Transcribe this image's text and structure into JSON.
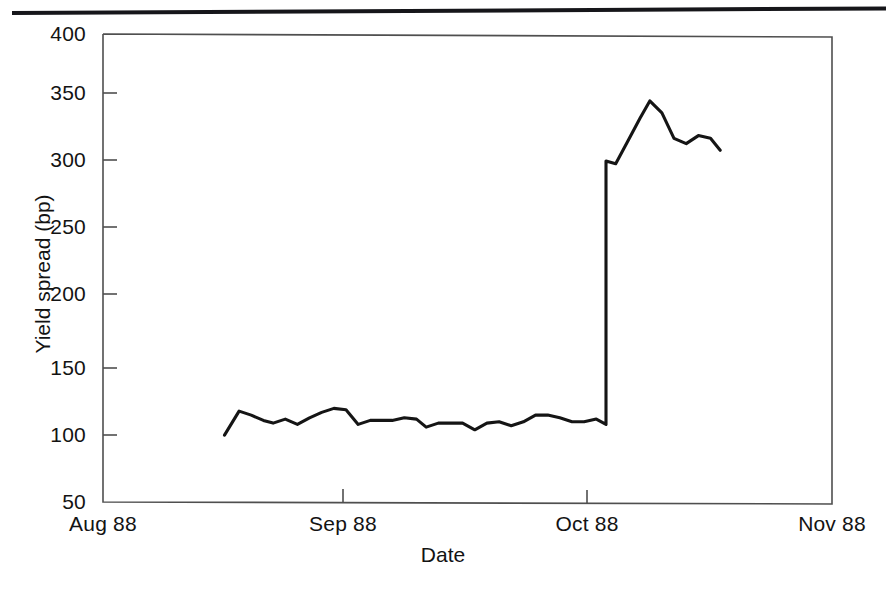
{
  "figure": {
    "page_rule": "horizontal-rule",
    "line_color": "#151515",
    "frame_color": "#4a4a4a"
  },
  "chart_data": {
    "type": "line",
    "title": "",
    "xlabel": "Date",
    "ylabel": "Yield spread (bp)",
    "ylim": [
      50,
      400
    ],
    "yticks": [
      50,
      100,
      150,
      200,
      250,
      300,
      350,
      400
    ],
    "ytick_labels": [
      "50",
      "100",
      "150",
      "200",
      "250",
      "300",
      "350",
      "400"
    ],
    "xticks": [
      0,
      1,
      2,
      3
    ],
    "xtick_labels": [
      "Aug 88",
      "Sep 88",
      "Oct 88",
      "Nov 88"
    ],
    "grid": false,
    "legend": null,
    "series": [
      {
        "name": "Yield spread",
        "x": [
          0.5,
          0.56,
          0.61,
          0.66,
          0.7,
          0.75,
          0.8,
          0.85,
          0.9,
          0.95,
          1.0,
          1.05,
          1.1,
          1.14,
          1.19,
          1.24,
          1.29,
          1.33,
          1.38,
          1.43,
          1.48,
          1.53,
          1.58,
          1.63,
          1.68,
          1.73,
          1.78,
          1.83,
          1.88,
          1.93,
          1.98,
          2.03,
          2.07,
          2.07,
          2.11,
          2.16,
          2.21,
          2.25,
          2.3,
          2.35,
          2.4,
          2.45,
          2.5,
          2.54
        ],
        "y": [
          100,
          118,
          115,
          111,
          109,
          112,
          108,
          113,
          117,
          120,
          119,
          108,
          111,
          111,
          111,
          113,
          112,
          106,
          109,
          109,
          109,
          104,
          109,
          110,
          107,
          110,
          115,
          115,
          113,
          110,
          110,
          112,
          108,
          305,
          303,
          320,
          337,
          350,
          341,
          322,
          318,
          324,
          322,
          313
        ]
      }
    ],
    "annotations": [
      {
        "text": "sharp jump in yield spread in early October 1988",
        "x": 2.07
      }
    ]
  }
}
